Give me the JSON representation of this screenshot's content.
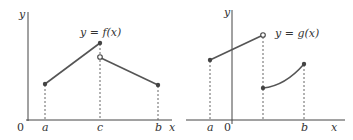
{
  "diagrams": [
    {
      "id": "f",
      "function_label": "y = f(x)",
      "axis_labels": {
        "y": "y",
        "x": "x",
        "origin": "0"
      },
      "tick_labels": [
        "a",
        "c",
        "b"
      ],
      "points": [
        {
          "label": "a-endpoint",
          "type": "filled"
        },
        {
          "label": "c-top",
          "type": "filled"
        },
        {
          "label": "c-jump",
          "type": "open"
        },
        {
          "label": "b-endpoint",
          "type": "filled"
        }
      ]
    },
    {
      "id": "g",
      "function_label": "y = g(x)",
      "axis_labels": {
        "y": "y",
        "x": "x",
        "origin": "0"
      },
      "tick_labels": [
        "a",
        "b"
      ],
      "points": [
        {
          "label": "a-endpoint",
          "type": "filled"
        },
        {
          "label": "jump-top",
          "type": "open"
        },
        {
          "label": "jump-bottom",
          "type": "filled"
        },
        {
          "label": "b-endpoint",
          "type": "filled"
        }
      ]
    }
  ]
}
